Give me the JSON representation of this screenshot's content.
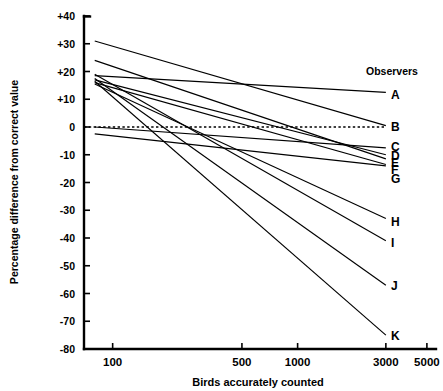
{
  "chart_data": {
    "type": "line",
    "title": "",
    "xlabel": "Birds accurately counted",
    "ylabel": "Percentage difference from correct value",
    "legend_title": "Observers",
    "legend_position": "right",
    "xscale": "log",
    "xlim": [
      70,
      5600
    ],
    "ylim": [
      -80,
      40
    ],
    "grid": false,
    "zero_reference_line": {
      "value": 0,
      "style": "dotted"
    },
    "xticks": [
      100,
      500,
      1000,
      3000,
      5000
    ],
    "xtick_labels": [
      "100",
      "500",
      "1000",
      "3000",
      "5000"
    ],
    "yticks": [
      40,
      30,
      20,
      10,
      0,
      -10,
      -20,
      -30,
      -40,
      -50,
      -60,
      -70,
      -80
    ],
    "ytick_labels": [
      "+40",
      "+30",
      "+20",
      "+10",
      "0",
      "-10",
      "-20",
      "-30",
      "-40",
      "-50",
      "-60",
      "-70",
      "-80"
    ],
    "series": [
      {
        "name": "A",
        "label": "A",
        "x": [
          80,
          3000
        ],
        "values": [
          18.5,
          12.5
        ]
      },
      {
        "name": "B",
        "label": "B",
        "x": [
          80,
          3000
        ],
        "values": [
          31.0,
          0.5
        ]
      },
      {
        "name": "C",
        "label": "C",
        "x": [
          80,
          3000
        ],
        "values": [
          0.0,
          -7.5
        ]
      },
      {
        "name": "D",
        "label": "D",
        "x": [
          80,
          3000
        ],
        "values": [
          17.0,
          -10.0
        ]
      },
      {
        "name": "E",
        "label": "E",
        "x": [
          80,
          3000
        ],
        "values": [
          24.0,
          -11.5
        ]
      },
      {
        "name": "F",
        "label": "F",
        "x": [
          80,
          3000
        ],
        "values": [
          16.0,
          -13.5
        ]
      },
      {
        "name": "G",
        "label": "G",
        "x": [
          80,
          3000
        ],
        "values": [
          -2.5,
          -14.0
        ]
      },
      {
        "name": "H",
        "label": "H",
        "x": [
          80,
          3000
        ],
        "values": [
          15.5,
          -33.0
        ]
      },
      {
        "name": "I",
        "label": "I",
        "x": [
          80,
          3000
        ],
        "values": [
          19.0,
          -41.0
        ]
      },
      {
        "name": "J",
        "label": "J",
        "x": [
          80,
          3000
        ],
        "values": [
          17.5,
          -57.0
        ]
      },
      {
        "name": "K",
        "label": "K",
        "x": [
          80,
          3000
        ],
        "values": [
          16.5,
          -75.0
        ]
      }
    ]
  }
}
